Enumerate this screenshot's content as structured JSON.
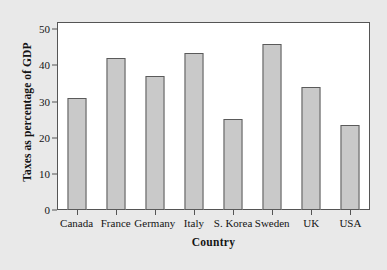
{
  "chart_data": {
    "type": "bar",
    "title": "",
    "subtitle": "",
    "xlabel": "Country",
    "ylabel": "Taxes as percentage of GDP",
    "categories": [
      "Canada",
      "France",
      "Germany",
      "Italy",
      "S. Korea",
      "Sweden",
      "UK",
      "USA"
    ],
    "values": [
      31,
      42,
      37,
      43.4,
      25.1,
      46,
      34,
      23.5
    ],
    "series": [
      {
        "name": "Taxes as percentage of GDP",
        "values": [
          31,
          42,
          37,
          43.4,
          25.1,
          46,
          34,
          23.5
        ]
      }
    ],
    "ylim": [
      0,
      52
    ],
    "xlim": [
      0,
      8
    ],
    "yticks": [
      0,
      10,
      20,
      30,
      40,
      50
    ],
    "ytick_labels": [
      "0",
      "10",
      "20",
      "30",
      "40",
      "50"
    ],
    "grid": false,
    "legend": false,
    "legend_position": "none",
    "bar_color": "#c9c9c9",
    "bar_edge_color": "#5a5a5a",
    "plot_background": "#ffffff",
    "figure_background": "#e9e9e9",
    "axis_color": "#555555",
    "text_color": "#141414"
  }
}
